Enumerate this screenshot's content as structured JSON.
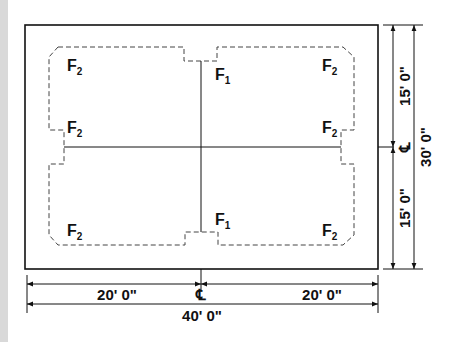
{
  "diagram": {
    "type": "foundation-plan",
    "colors": {
      "line": "#111111",
      "background": "#ffffff",
      "side_bar": "#d9d9d9"
    },
    "footing_labels": [
      {
        "id": "tl-top",
        "base": "F",
        "sub": "2"
      },
      {
        "id": "tl-mid",
        "base": "F",
        "sub": "2"
      },
      {
        "id": "tr-top",
        "base": "F",
        "sub": "2"
      },
      {
        "id": "tr-mid",
        "base": "F",
        "sub": "2"
      },
      {
        "id": "bl",
        "base": "F",
        "sub": "2"
      },
      {
        "id": "br",
        "base": "F",
        "sub": "2"
      },
      {
        "id": "center-top",
        "base": "F",
        "sub": "1"
      },
      {
        "id": "center-bottom",
        "base": "F",
        "sub": "1"
      }
    ],
    "dimensions": {
      "bottom_left": "20' 0\"",
      "bottom_right": "20' 0\"",
      "bottom_total": "40' 0\"",
      "right_top": "15' 0\"",
      "right_bottom": "15' 0\"",
      "right_total": "30' 0\""
    },
    "centerline_symbol": "℄"
  }
}
